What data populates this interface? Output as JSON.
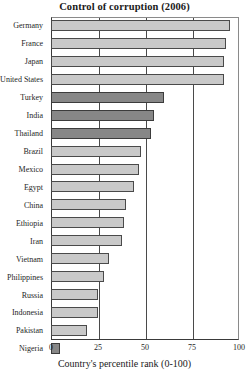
{
  "chart_data": {
    "type": "bar",
    "orientation": "horizontal",
    "title": "Control of corruption (2006)",
    "xlabel": "Country's percentile rank (0-100)",
    "ylabel": "",
    "xlim": [
      0,
      100
    ],
    "xticks": [
      0,
      25,
      50,
      75,
      100
    ],
    "xtick_labels": [
      "0",
      "25",
      "50",
      "75",
      "100"
    ],
    "grid": true,
    "grid_axis": "x",
    "legend": false,
    "categories": [
      "Germany",
      "France",
      "Japan",
      "United States",
      "Turkey",
      "India",
      "Thailand",
      "Brazil",
      "Mexico",
      "Egypt",
      "China",
      "Ethiopia",
      "Iran",
      "Vietnam",
      "Philippines",
      "Russia",
      "Indonesia",
      "Pakistan",
      "Nigeria"
    ],
    "values": [
      95,
      93,
      92,
      92,
      60,
      55,
      53,
      48,
      47,
      44,
      40,
      39,
      38,
      31,
      28,
      25,
      25,
      19,
      5
    ],
    "highlighted": [
      "Turkey",
      "India",
      "Thailand",
      "Nigeria"
    ],
    "bars": [
      {
        "label": "Germany",
        "value": 95,
        "highlight": false
      },
      {
        "label": "France",
        "value": 93,
        "highlight": false
      },
      {
        "label": "Japan",
        "value": 92,
        "highlight": false
      },
      {
        "label": "United States",
        "value": 92,
        "highlight": false
      },
      {
        "label": "Turkey",
        "value": 60,
        "highlight": true
      },
      {
        "label": "India",
        "value": 55,
        "highlight": true
      },
      {
        "label": "Thailand",
        "value": 53,
        "highlight": true
      },
      {
        "label": "Brazil",
        "value": 48,
        "highlight": false
      },
      {
        "label": "Mexico",
        "value": 47,
        "highlight": false
      },
      {
        "label": "Egypt",
        "value": 44,
        "highlight": false
      },
      {
        "label": "China",
        "value": 40,
        "highlight": false
      },
      {
        "label": "Ethiopia",
        "value": 39,
        "highlight": false
      },
      {
        "label": "Iran",
        "value": 38,
        "highlight": false
      },
      {
        "label": "Vietnam",
        "value": 31,
        "highlight": false
      },
      {
        "label": "Philippines",
        "value": 28,
        "highlight": false
      },
      {
        "label": "Russia",
        "value": 25,
        "highlight": false
      },
      {
        "label": "Indonesia",
        "value": 25,
        "highlight": false
      },
      {
        "label": "Pakistan",
        "value": 19,
        "highlight": false
      },
      {
        "label": "Nigeria",
        "value": 5,
        "highlight": true
      }
    ],
    "colors": {
      "bar_fill": "#c9c9c9",
      "bar_fill_highlight": "#878787",
      "bar_edge": "#4a4a4a",
      "axis": "#3a3a3a",
      "grid": "#4a4a4a",
      "text": "#1a1a1a",
      "background": "#ffffff"
    }
  }
}
